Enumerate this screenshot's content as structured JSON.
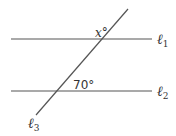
{
  "diagram": {
    "type": "parallel-lines-transversal",
    "lines": [
      {
        "id": "l1",
        "label": "ℓ",
        "subscript": "1",
        "kind": "parallel",
        "x1": 11,
        "y1": 39,
        "x2": 152,
        "y2": 39
      },
      {
        "id": "l2",
        "label": "ℓ",
        "subscript": "2",
        "kind": "parallel",
        "x1": 11,
        "y1": 91,
        "x2": 152,
        "y2": 91
      },
      {
        "id": "l3",
        "label": "ℓ",
        "subscript": "3",
        "kind": "transversal",
        "x1": 128,
        "y1": 9,
        "x2": 36,
        "y2": 115
      }
    ],
    "angles": [
      {
        "id": "angle-x",
        "text": "x°",
        "at_line": "l1"
      },
      {
        "id": "angle-70",
        "text": "70°",
        "at_line": "l2"
      }
    ],
    "colors": {
      "stroke": "#555555",
      "text": "#333333",
      "background": "#ffffff"
    }
  }
}
